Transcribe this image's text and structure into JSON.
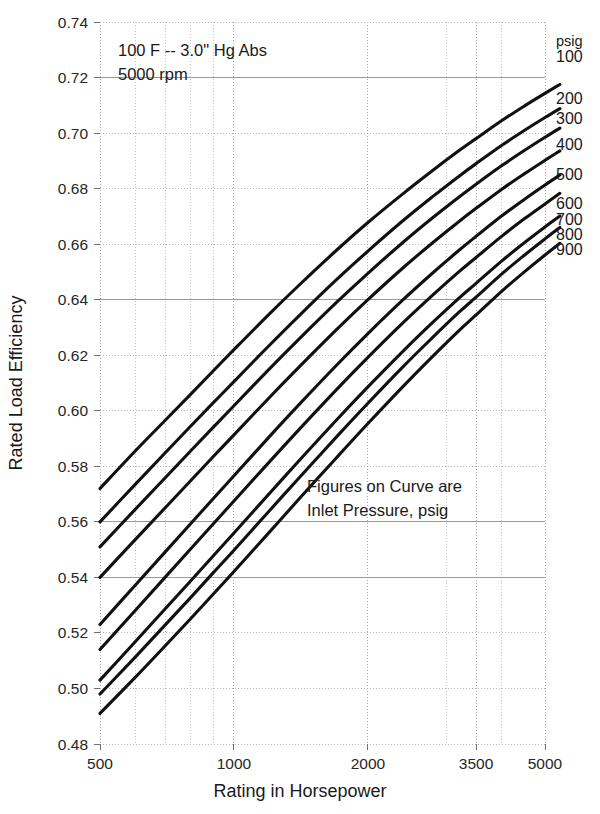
{
  "chart_data": {
    "type": "line",
    "title": "",
    "xlabel": "Rating in Horsepower",
    "ylabel": "Rated Load Efficiency",
    "xscale": "log",
    "xlim": [
      500,
      5500
    ],
    "ylim": [
      0.48,
      0.74
    ],
    "grid": true,
    "legend_position": "right",
    "legend_title": "psig",
    "x_ticks": [
      500,
      1000,
      2000,
      3500,
      5000
    ],
    "x_tick_labels": [
      "500",
      "1000",
      "2000",
      "3500",
      "5000"
    ],
    "y_ticks": [
      0.48,
      0.5,
      0.52,
      0.54,
      0.56,
      0.58,
      0.6,
      0.62,
      0.64,
      0.66,
      0.68,
      0.7,
      0.72,
      0.74
    ],
    "y_tick_labels": [
      "0.48",
      "0.50",
      "0.52",
      "0.54",
      "0.56",
      "0.58",
      "0.60",
      "0.62",
      "0.64",
      "0.66",
      "0.68",
      "0.70",
      "0.72",
      "0.74"
    ],
    "annotations": [
      "100 F -- 3.0\" Hg Abs",
      "5000 rpm",
      "Figures on Curve are",
      "Inlet Pressure, psig"
    ],
    "x": [
      500,
      600,
      700,
      800,
      900,
      1000,
      1200,
      1400,
      1700,
      2000,
      2400,
      2800,
      3200,
      3500,
      4000,
      4500,
      5000,
      5400
    ],
    "series": [
      {
        "name": "100",
        "label": "100",
        "values": [
          0.572,
          0.5855,
          0.5965,
          0.606,
          0.6145,
          0.622,
          0.6348,
          0.6452,
          0.6578,
          0.6678,
          0.6782,
          0.6866,
          0.6936,
          0.698,
          0.7045,
          0.7098,
          0.7143,
          0.7175
        ]
      },
      {
        "name": "200",
        "label": "200",
        "values": [
          0.56,
          0.5735,
          0.5848,
          0.5945,
          0.603,
          0.6105,
          0.6235,
          0.6342,
          0.6472,
          0.6575,
          0.6685,
          0.6772,
          0.6844,
          0.689,
          0.6956,
          0.701,
          0.7056,
          0.7088
        ]
      },
      {
        "name": "300",
        "label": "300",
        "values": [
          0.551,
          0.5645,
          0.5758,
          0.5856,
          0.5942,
          0.6018,
          0.615,
          0.6258,
          0.639,
          0.6495,
          0.6607,
          0.6696,
          0.6769,
          0.6816,
          0.6883,
          0.6938,
          0.6985,
          0.7018
        ]
      },
      {
        "name": "400",
        "label": "400",
        "values": [
          0.54,
          0.5536,
          0.565,
          0.5749,
          0.5836,
          0.5913,
          0.6047,
          0.6157,
          0.6292,
          0.64,
          0.6515,
          0.6606,
          0.6681,
          0.6729,
          0.6798,
          0.6854,
          0.6902,
          0.6936
        ]
      },
      {
        "name": "500",
        "label": "500",
        "values": [
          0.523,
          0.5372,
          0.5491,
          0.5594,
          0.5685,
          0.5766,
          0.5906,
          0.6022,
          0.6164,
          0.6278,
          0.64,
          0.6497,
          0.6577,
          0.6628,
          0.6702,
          0.6762,
          0.6813,
          0.6849
        ]
      },
      {
        "name": "600",
        "label": "600",
        "values": [
          0.514,
          0.5281,
          0.54,
          0.5503,
          0.5594,
          0.5675,
          0.5815,
          0.5932,
          0.6076,
          0.6192,
          0.6317,
          0.6417,
          0.65,
          0.6552,
          0.6629,
          0.6692,
          0.6745,
          0.6783
        ]
      },
      {
        "name": "700",
        "label": "700",
        "values": [
          0.503,
          0.5168,
          0.5286,
          0.5388,
          0.5479,
          0.556,
          0.5701,
          0.582,
          0.5967,
          0.6086,
          0.6215,
          0.6319,
          0.6405,
          0.6459,
          0.654,
          0.6606,
          0.6662,
          0.6701
        ]
      },
      {
        "name": "800",
        "label": "800",
        "values": [
          0.498,
          0.5113,
          0.5228,
          0.5328,
          0.5418,
          0.5498,
          0.5639,
          0.5758,
          0.5906,
          0.6027,
          0.6159,
          0.6265,
          0.6354,
          0.6409,
          0.6493,
          0.6561,
          0.6619,
          0.666
        ]
      },
      {
        "name": "900",
        "label": "900",
        "values": [
          0.491,
          0.504,
          0.5153,
          0.5252,
          0.5341,
          0.5421,
          0.5562,
          0.5682,
          0.5831,
          0.5954,
          0.6088,
          0.6197,
          0.6288,
          0.6345,
          0.6431,
          0.6501,
          0.6561,
          0.6603
        ]
      }
    ]
  },
  "axes": {
    "y_title": "Rated Load Efficiency",
    "x_title": "Rating in Horsepower"
  },
  "legend": {
    "header": "psig"
  },
  "annotation_block_1": {
    "line1": "100 F -- 3.0\" Hg Abs",
    "line2": "5000 rpm"
  },
  "annotation_block_2": {
    "line1": "Figures on Curve are",
    "line2": "Inlet Pressure, psig"
  }
}
